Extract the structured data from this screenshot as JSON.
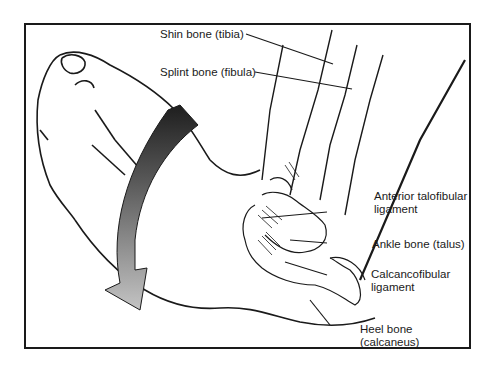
{
  "figure": {
    "labels": {
      "tibia": "Shin bone (tibia)",
      "fibula": "Splint bone (fibula)",
      "atfl_line1": "Anterior talofibular",
      "atfl_line2": "ligament",
      "talus": "Ankle bone (talus)",
      "cfl_line1": "Calcancofibular",
      "cfl_line2": "ligament",
      "calcaneus_line1": "Heel bone",
      "calcaneus_line2": "(calcaneus)"
    },
    "colors": {
      "line": "#1a1a1a",
      "background": "#ffffff",
      "arrow_dark": "#2a2a2a",
      "arrow_light": "#b8b8b8"
    }
  }
}
